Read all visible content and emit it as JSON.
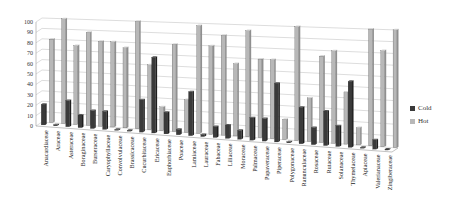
{
  "chart_data": {
    "type": "bar",
    "style": "3d-clustered-column",
    "title": "",
    "xlabel": "",
    "ylabel": "",
    "ylim": [
      0,
      100
    ],
    "yticks": [
      0,
      10,
      20,
      30,
      40,
      50,
      60,
      70,
      80,
      90,
      100
    ],
    "grid": true,
    "legend_position": "right",
    "categories": [
      "Anacardiaceae",
      "Araceae",
      "Asteraceae",
      "Boraginaceae",
      "Burseraceae",
      "Caryophyllaceae",
      "Convolvulaceae",
      "Brassicaceae",
      "Cucurbitaceae",
      "Ericaceae",
      "Euphorbiaceae",
      "Poaceae",
      "Lamiaceae",
      "Lauraceae",
      "Fabaceae",
      "Liliaceae",
      "Moraceae",
      "Palmaceae",
      "Papaveraceae",
      "Piperaceae",
      "Polygonaceae",
      "Ranunculaceae",
      "Rosaceae",
      "Rutaceae",
      "Solanaceae",
      "Thymelaceae",
      "Apiaceae",
      "Valerianaceae",
      "Zingiberaceae"
    ],
    "series": [
      {
        "name": "Cold",
        "color": "#3a3a3a",
        "values": [
          20,
          0,
          25,
          12,
          17,
          17,
          0,
          0,
          30,
          70,
          20,
          5,
          40,
          2,
          10,
          12,
          8,
          20,
          20,
          52,
          0,
          32,
          15,
          30,
          18,
          57,
          0,
          8,
          0
        ]
      },
      {
        "name": "Hot",
        "color": "#b8b8b8",
        "values": [
          80,
          100,
          75,
          88,
          80,
          80,
          75,
          100,
          60,
          22,
          80,
          30,
          98,
          80,
          90,
          65,
          95,
          70,
          70,
          18,
          100,
          38,
          75,
          80,
          45,
          15,
          100,
          82,
          100
        ]
      }
    ]
  },
  "legend": {
    "items": [
      {
        "label": "Cold",
        "color": "#3a3a3a"
      },
      {
        "label": "Hot",
        "color": "#b8b8b8"
      }
    ]
  }
}
